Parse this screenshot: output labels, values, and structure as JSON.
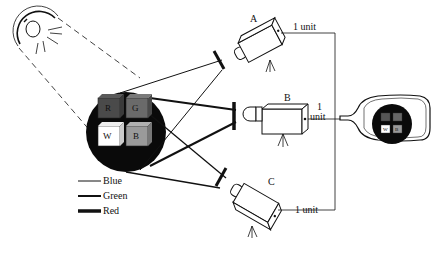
{
  "diagram": {
    "type": "trichromatic color camera schematic",
    "light_source": {
      "icon": "light-bulb-icon"
    },
    "scene": {
      "cubes": [
        {
          "label": "R",
          "color": "#4a4a4a"
        },
        {
          "label": "G",
          "color": "#6a6a6a"
        },
        {
          "label": "W",
          "color": "#ffffff"
        },
        {
          "label": "B",
          "color": "#9a9a9a"
        }
      ]
    },
    "cameras": [
      {
        "id": "A",
        "label": "A",
        "wire_label": "1 unit",
        "filter": "Blue"
      },
      {
        "id": "B",
        "label": "B",
        "wire_label_line1": "1",
        "wire_label_line2": "unit",
        "filter": "Green"
      },
      {
        "id": "C",
        "label": "C",
        "wire_label": "1 unit",
        "filter": "Red"
      }
    ],
    "display": {
      "icon": "tv-monitor-icon",
      "mini_cubes": [
        {
          "label": "R",
          "color": "#555555"
        },
        {
          "label": "G",
          "color": "#666666"
        },
        {
          "label": "W",
          "color": "#ffffff"
        },
        {
          "label": "B",
          "color": "#999999"
        }
      ]
    },
    "legend": [
      {
        "label": "Blue",
        "stroke_width": 1
      },
      {
        "label": "Green",
        "stroke_width": 2
      },
      {
        "label": "Red",
        "stroke_width": 3.5
      }
    ]
  }
}
